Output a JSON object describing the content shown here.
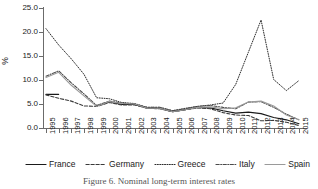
{
  "axis": {
    "ylabel": "%",
    "yticks": [
      "0.0",
      "5.0",
      "10.0",
      "15.0",
      "20.0",
      "25.0"
    ],
    "xticks": [
      "1995",
      "1996",
      "1997",
      "1998",
      "1999",
      "2000",
      "2001",
      "2002",
      "2003",
      "2004",
      "2005",
      "2006",
      "2007",
      "2008",
      "2009",
      "2010",
      "2011",
      "2012",
      "2013",
      "2014",
      "2015"
    ]
  },
  "legend": {
    "items": [
      {
        "label": "France",
        "style": "solid",
        "color": "#1a1a1a",
        "swatch": "line-solid-icon"
      },
      {
        "label": "Germany",
        "style": "dashed",
        "color": "#3a3a3a",
        "swatch": "line-dashed-icon"
      },
      {
        "label": "Greece",
        "style": "dotted",
        "color": "#2b2b2b",
        "swatch": "line-dotted-icon"
      },
      {
        "label": "Italy",
        "style": "dashdot",
        "color": "#4a4a4a",
        "swatch": "line-dashdot-icon"
      },
      {
        "label": "Spain",
        "style": "solid",
        "color": "#9a9a9a",
        "swatch": "line-gray-icon"
      }
    ]
  },
  "caption": {
    "text": "Figure 6. Nominal long-term interest rates"
  },
  "chart_data": {
    "type": "line",
    "title": "",
    "xlabel": "",
    "ylabel": "%",
    "ylim": [
      0.0,
      25.0
    ],
    "ytick_step": 5.0,
    "grid": false,
    "legend_position": "bottom",
    "x": [
      1995,
      1996,
      1997,
      1998,
      1999,
      2000,
      2001,
      2002,
      2003,
      2004,
      2005,
      2006,
      2007,
      2008,
      2009,
      2010,
      2011,
      2012,
      2013,
      2014,
      2015
    ],
    "series": [
      {
        "name": "France",
        "color": "#1a1a1a",
        "dash": "solid",
        "values": [
          7.0,
          7.0,
          null,
          null,
          4.6,
          5.4,
          4.9,
          4.9,
          4.1,
          4.1,
          3.4,
          3.8,
          4.3,
          4.2,
          3.6,
          3.1,
          3.3,
          3.0,
          2.2,
          1.7,
          0.9
        ]
      },
      {
        "name": "Germany",
        "color": "#3a3a3a",
        "dash": "dashed",
        "values": [
          6.9,
          6.2,
          5.6,
          4.6,
          4.5,
          5.3,
          4.8,
          4.8,
          4.1,
          4.0,
          3.4,
          3.8,
          4.2,
          4.0,
          3.2,
          2.7,
          2.6,
          1.5,
          1.6,
          1.2,
          0.5
        ]
      },
      {
        "name": "Greece",
        "color": "#2b2b2b",
        "dash": "dotted",
        "values": [
          20.7,
          17.3,
          14.4,
          11.2,
          6.3,
          6.1,
          5.3,
          5.1,
          4.3,
          4.3,
          3.6,
          4.1,
          4.5,
          4.8,
          5.2,
          9.1,
          15.8,
          22.5,
          10.1,
          7.8,
          9.9
        ]
      },
      {
        "name": "Italy",
        "color": "#4a4a4a",
        "dash": "dashdot",
        "values": [
          10.8,
          11.9,
          9.4,
          7.1,
          4.7,
          5.6,
          5.2,
          5.0,
          4.3,
          4.3,
          3.6,
          4.0,
          4.5,
          4.7,
          4.3,
          4.0,
          5.4,
          5.5,
          4.3,
          2.9,
          1.7
        ]
      },
      {
        "name": "Spain",
        "color": "#9a9a9a",
        "dash": "solid",
        "values": [
          10.5,
          11.6,
          8.9,
          6.7,
          4.5,
          5.5,
          5.1,
          5.0,
          4.1,
          4.1,
          3.4,
          3.8,
          4.3,
          4.4,
          4.0,
          4.2,
          5.4,
          5.6,
          4.6,
          2.7,
          1.7
        ]
      }
    ]
  }
}
